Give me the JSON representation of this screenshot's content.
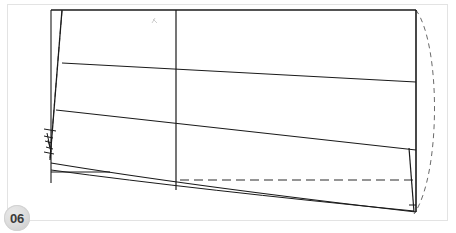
{
  "viewer": {
    "width": 456,
    "height": 233,
    "background_color": "#ffffff",
    "border_color": "#e3e3e3"
  },
  "page_badge": {
    "label": "06",
    "icon": "page-number-badge",
    "background_color": "#dedede",
    "text_color": "#3b3b3b"
  },
  "drawing": {
    "title": "",
    "stroke_color": "#1a1a1a",
    "dashed_color": "#4a4a4a",
    "faint_color": "#c8c8c8",
    "solid_lines": [
      {
        "name": "top-edge",
        "x1": 51,
        "y1": 10,
        "x2": 416,
        "y2": 10
      },
      {
        "name": "left-vertical-axis",
        "x1": 51,
        "y1": 10,
        "x2": 51,
        "y2": 183
      },
      {
        "name": "right-vertical-edge",
        "x1": 416,
        "y1": 10,
        "x2": 416,
        "y2": 212
      },
      {
        "name": "center-vertical-axis",
        "x1": 176,
        "y1": 10,
        "x2": 176,
        "y2": 190
      },
      {
        "name": "left-slant-seam",
        "x1": 62,
        "y1": 10,
        "x2": 50,
        "y2": 160
      },
      {
        "name": "horizontal-rule-1",
        "x1": 62,
        "y1": 63,
        "x2": 416,
        "y2": 82
      },
      {
        "name": "horizontal-rule-2",
        "x1": 56,
        "y1": 110,
        "x2": 416,
        "y2": 150
      },
      {
        "name": "lower-curve-chord",
        "x1": 51,
        "y1": 163,
        "x2": 416,
        "y2": 212
      },
      {
        "name": "bottom-short-rule",
        "x1": 51,
        "y1": 172,
        "x2": 110,
        "y2": 172
      },
      {
        "name": "bottom-right-stub",
        "x1": 409,
        "y1": 148,
        "x2": 414,
        "y2": 212
      },
      {
        "name": "bottom-right-closer",
        "x1": 409,
        "y1": 205,
        "x2": 416,
        "y2": 205
      }
    ],
    "curves": [
      {
        "name": "bottom-sweep-curve",
        "d": "M51,163 Q190,186 416,212"
      },
      {
        "name": "bottom-sweep-curve-2",
        "d": "M51,170 Q200,190 414,211"
      }
    ],
    "dashed_lines": [
      {
        "name": "left-inner-dashed-guide",
        "x1": 62,
        "y1": 11,
        "x2": 50,
        "y2": 158
      },
      {
        "name": "bottom-center-dashed-rule",
        "x1": 180,
        "y1": 180,
        "x2": 416,
        "y2": 180
      }
    ],
    "dashed_curves": [
      {
        "name": "right-bulge-dashed-arc",
        "d": "M416,10 C441,45 441,175 414,214"
      }
    ],
    "hatch_marks": {
      "name": "left-zigzag-notch-marks",
      "d": "M44,129 L56,131 M44,136 L53,138 M45,141 L52,143 M46,147 L53,149 M44,152 L54,154 M47,133 L50,147 M48,140 L51,152"
    },
    "faint_marks": [
      {
        "name": "faint-annotation-mark",
        "d": "M153,19 L157,23 M155,18 L152,23"
      }
    ]
  }
}
